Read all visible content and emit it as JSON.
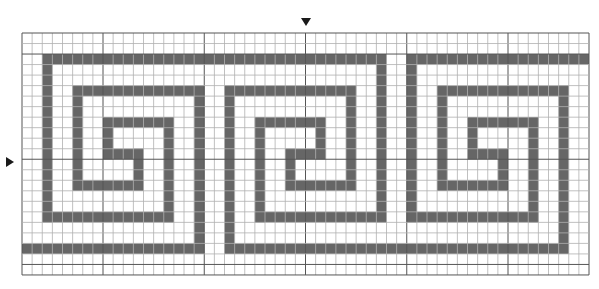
{
  "grid": {
    "cols": 56,
    "rows": 23,
    "origin_x": 22,
    "origin_y": 33,
    "cell_w": 10.125,
    "cell_h": 10.52,
    "center_col": 28,
    "center_row": 12
  },
  "colors": {
    "background": "#ffffff",
    "fill": "#666666",
    "grid_line": "#b0b0b0",
    "major_line": "#555555",
    "marker": "#1a1a1a"
  },
  "markers": {
    "top": {
      "x": 306,
      "y": 18
    },
    "left": {
      "x": 6,
      "y": 157
    }
  },
  "filled_segments": [
    {
      "orient": "h",
      "row": 2,
      "from": 2,
      "to": 35
    },
    {
      "orient": "h",
      "row": 2,
      "from": 38,
      "to": 55
    },
    {
      "orient": "v",
      "col": 2,
      "from": 2,
      "to": 17
    },
    {
      "orient": "h",
      "row": 17,
      "from": 2,
      "to": 14
    },
    {
      "orient": "v",
      "col": 14,
      "from": 8,
      "to": 17
    },
    {
      "orient": "h",
      "row": 8,
      "from": 8,
      "to": 14
    },
    {
      "orient": "v",
      "col": 8,
      "from": 8,
      "to": 11
    },
    {
      "orient": "h",
      "row": 11,
      "from": 8,
      "to": 11
    },
    {
      "orient": "v",
      "col": 11,
      "from": 11,
      "to": 14
    },
    {
      "orient": "h",
      "row": 14,
      "from": 5,
      "to": 11
    },
    {
      "orient": "v",
      "col": 5,
      "from": 5,
      "to": 14
    },
    {
      "orient": "h",
      "row": 5,
      "from": 5,
      "to": 17
    },
    {
      "orient": "v",
      "col": 17,
      "from": 5,
      "to": 20
    },
    {
      "orient": "h",
      "row": 20,
      "from": 0,
      "to": 17
    },
    {
      "orient": "v",
      "col": 20,
      "from": 5,
      "to": 20
    },
    {
      "orient": "h",
      "row": 5,
      "from": 20,
      "to": 32
    },
    {
      "orient": "v",
      "col": 32,
      "from": 5,
      "to": 14
    },
    {
      "orient": "h",
      "row": 14,
      "from": 26,
      "to": 32
    },
    {
      "orient": "v",
      "col": 26,
      "from": 11,
      "to": 14
    },
    {
      "orient": "h",
      "row": 11,
      "from": 26,
      "to": 29
    },
    {
      "orient": "v",
      "col": 29,
      "from": 8,
      "to": 11
    },
    {
      "orient": "h",
      "row": 8,
      "from": 23,
      "to": 29
    },
    {
      "orient": "v",
      "col": 23,
      "from": 8,
      "to": 17
    },
    {
      "orient": "h",
      "row": 17,
      "from": 23,
      "to": 35
    },
    {
      "orient": "v",
      "col": 35,
      "from": 2,
      "to": 17
    },
    {
      "orient": "h",
      "row": 20,
      "from": 20,
      "to": 53
    },
    {
      "orient": "v",
      "col": 38,
      "from": 2,
      "to": 17
    },
    {
      "orient": "h",
      "row": 17,
      "from": 38,
      "to": 50
    },
    {
      "orient": "v",
      "col": 50,
      "from": 8,
      "to": 17
    },
    {
      "orient": "h",
      "row": 8,
      "from": 44,
      "to": 50
    },
    {
      "orient": "v",
      "col": 44,
      "from": 8,
      "to": 11
    },
    {
      "orient": "h",
      "row": 11,
      "from": 44,
      "to": 47
    },
    {
      "orient": "v",
      "col": 47,
      "from": 11,
      "to": 14
    },
    {
      "orient": "h",
      "row": 14,
      "from": 41,
      "to": 47
    },
    {
      "orient": "v",
      "col": 41,
      "from": 5,
      "to": 14
    },
    {
      "orient": "h",
      "row": 5,
      "from": 41,
      "to": 53
    },
    {
      "orient": "v",
      "col": 53,
      "from": 5,
      "to": 20
    }
  ]
}
